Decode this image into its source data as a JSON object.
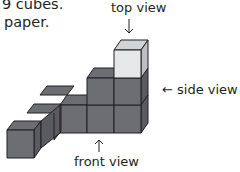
{
  "text": {
    "line1": "9 cubes.",
    "line2": "paper."
  },
  "labels": {
    "top_view": "top view",
    "side_view": "side view",
    "front_view": "front view",
    "side_arrow": "←"
  },
  "colors": {
    "cube_dark": "#6d6e71",
    "cube_dark_top": "#6d6e71",
    "cube_light": "#d1d3d4",
    "edge": "#231f20"
  }
}
